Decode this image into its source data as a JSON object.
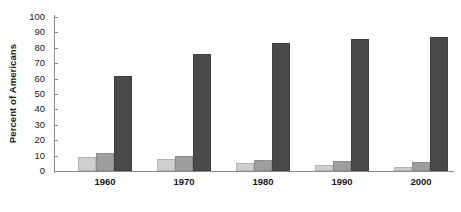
{
  "chart_data": {
    "type": "bar",
    "title": "",
    "xlabel": "",
    "ylabel": "Percent of Americans",
    "ylim": [
      0,
      100
    ],
    "yticks": [
      0,
      10,
      20,
      30,
      40,
      50,
      60,
      70,
      80,
      90,
      100
    ],
    "grid": false,
    "legend": "none",
    "categories": [
      "1960",
      "1970",
      "1980",
      "1990",
      "2000"
    ],
    "series": [
      {
        "name": "series-1",
        "color": "#cfcfcf",
        "values": [
          9,
          8,
          5.5,
          4,
          2.5
        ]
      },
      {
        "name": "series-2",
        "color": "#9e9e9e",
        "values": [
          11.5,
          10,
          7,
          6.5,
          6
        ]
      },
      {
        "name": "series-3",
        "color": "#4a4a4a",
        "values": [
          62,
          76,
          83,
          86,
          87
        ]
      }
    ]
  }
}
